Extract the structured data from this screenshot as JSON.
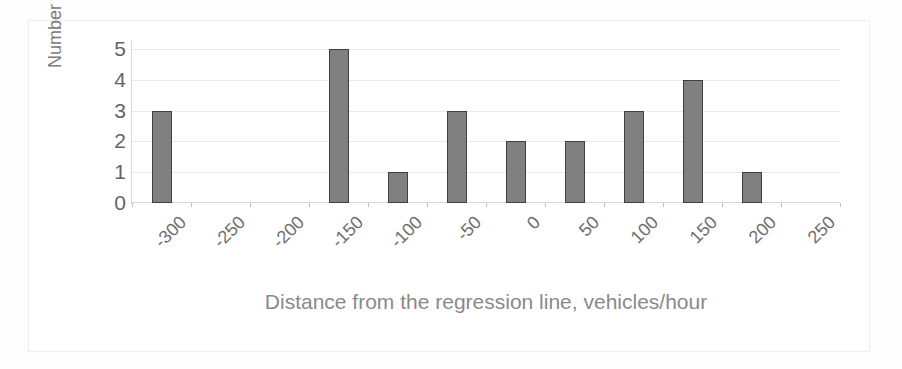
{
  "chart_data": {
    "type": "bar",
    "title": "",
    "xlabel": "Distance from the regression line, vehicles/hour",
    "ylabel": "Number of cases",
    "categories": [
      "-300",
      "-250",
      "-200",
      "-150",
      "-100",
      "-50",
      "0",
      "50",
      "100",
      "150",
      "200",
      "250"
    ],
    "values": [
      3,
      0,
      0,
      5,
      1,
      3,
      2,
      2,
      3,
      4,
      1,
      0
    ],
    "ylim": [
      0,
      5
    ],
    "yticks": [
      "5",
      "4",
      "3",
      "2",
      "1",
      "0"
    ],
    "ytick_values": [
      5,
      4,
      3,
      2,
      1,
      0
    ],
    "grid": true,
    "legend": false,
    "bar_color": "#808080",
    "bar_edge_color": "#3f3f3f",
    "gridline_color": "#e9e9e9",
    "axis_color": "#d6d6d6",
    "text_color": "#6e6e6e",
    "xtick_rotation": -45
  }
}
